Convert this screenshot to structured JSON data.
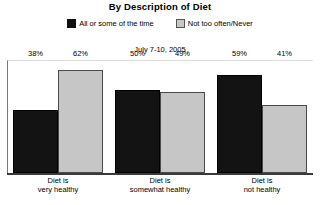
{
  "chart_data": {
    "type": "bar",
    "title": "By Description of Diet",
    "subtitle": "July 7-10, 2005",
    "xlabel": "",
    "ylabel": "",
    "ylim": [
      0,
      100
    ],
    "grid": false,
    "legend_position": "top-center",
    "categories": [
      {
        "line1": "Diet is",
        "line2": "very healthy"
      },
      {
        "line1": "Diet is",
        "line2": "somewhat healthy"
      },
      {
        "line1": "Diet is",
        "line2": "not healthy"
      }
    ],
    "series": [
      {
        "name": "All or some of the time",
        "color": "#131313",
        "values": [
          38,
          50,
          59
        ],
        "labels": [
          "38%",
          "50%",
          "59%"
        ]
      },
      {
        "name": "Not too often/Never",
        "color": "#c6c6c6",
        "values": [
          62,
          49,
          41
        ],
        "labels": [
          "62%",
          "49%",
          "41%"
        ]
      }
    ]
  },
  "legend": {
    "items": [
      {
        "label": "All or some of the time",
        "swatch": "dark"
      },
      {
        "label": "Not too often/Never",
        "swatch": "light"
      }
    ]
  }
}
